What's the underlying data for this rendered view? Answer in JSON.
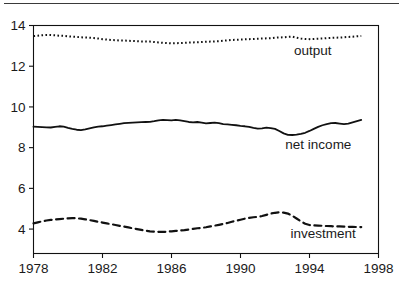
{
  "figure": {
    "top_rule": true,
    "background_color": "#ffffff",
    "line_color": "#111111"
  },
  "chart_data": {
    "type": "line",
    "title": "",
    "subtitle": "",
    "xlabel": "",
    "ylabel": "",
    "xlim": [
      1978,
      1998
    ],
    "ylim": [
      2.8,
      14
    ],
    "grid": false,
    "legend_position": "inline-right",
    "xticks": [
      1978,
      1982,
      1986,
      1990,
      1994,
      1998
    ],
    "xtick_labels": [
      "1978",
      "1982",
      "1986",
      "1990",
      "1994",
      "1998"
    ],
    "yticks": [
      4,
      6,
      8,
      10,
      12,
      14
    ],
    "ytick_labels": [
      "4",
      "6",
      "8",
      "10",
      "12",
      "14"
    ],
    "x": [
      1978.0,
      1978.25,
      1978.5,
      1978.75,
      1979.0,
      1979.25,
      1979.5,
      1979.75,
      1980.0,
      1980.25,
      1980.5,
      1980.75,
      1981.0,
      1981.25,
      1981.5,
      1981.75,
      1982.0,
      1982.25,
      1982.5,
      1982.75,
      1983.0,
      1983.25,
      1983.5,
      1983.75,
      1984.0,
      1984.25,
      1984.5,
      1984.75,
      1985.0,
      1985.25,
      1985.5,
      1985.75,
      1986.0,
      1986.25,
      1986.5,
      1986.75,
      1987.0,
      1987.25,
      1987.5,
      1987.75,
      1988.0,
      1988.25,
      1988.5,
      1988.75,
      1989.0,
      1989.25,
      1989.5,
      1989.75,
      1990.0,
      1990.25,
      1990.5,
      1990.75,
      1991.0,
      1991.25,
      1991.5,
      1991.75,
      1992.0,
      1992.25,
      1992.5,
      1992.75,
      1993.0,
      1993.25,
      1993.5,
      1993.75,
      1994.0,
      1994.25,
      1994.5,
      1994.75,
      1995.0,
      1995.25,
      1995.5,
      1995.75,
      1996.0,
      1996.25,
      1996.5,
      1996.75,
      1997.0
    ],
    "series": [
      {
        "name": "output",
        "label": "output",
        "style": "dotted",
        "label_x": 1993.1,
        "label_y": 12.55,
        "values": [
          13.48,
          13.5,
          13.52,
          13.53,
          13.53,
          13.52,
          13.5,
          13.49,
          13.47,
          13.45,
          13.44,
          13.42,
          13.41,
          13.4,
          13.38,
          13.36,
          13.33,
          13.31,
          13.29,
          13.28,
          13.26,
          13.26,
          13.25,
          13.24,
          13.23,
          13.22,
          13.22,
          13.21,
          13.19,
          13.17,
          13.15,
          13.14,
          13.12,
          13.13,
          13.14,
          13.15,
          13.16,
          13.17,
          13.18,
          13.19,
          13.2,
          13.21,
          13.22,
          13.23,
          13.25,
          13.27,
          13.29,
          13.3,
          13.31,
          13.32,
          13.33,
          13.34,
          13.35,
          13.36,
          13.37,
          13.38,
          13.4,
          13.41,
          13.42,
          13.44,
          13.45,
          13.4,
          13.36,
          13.34,
          13.33,
          13.34,
          13.35,
          13.36,
          13.38,
          13.39,
          13.4,
          13.41,
          13.42,
          13.44,
          13.45,
          13.47,
          13.48
        ]
      },
      {
        "name": "net-income",
        "label": "net income",
        "style": "solid",
        "label_x": 1992.6,
        "label_y": 7.95,
        "values": [
          9.03,
          9.02,
          9.01,
          9.0,
          8.99,
          9.02,
          9.05,
          9.03,
          8.97,
          8.92,
          8.88,
          8.86,
          8.9,
          8.95,
          9.0,
          9.03,
          9.05,
          9.08,
          9.11,
          9.14,
          9.17,
          9.2,
          9.22,
          9.23,
          9.24,
          9.25,
          9.26,
          9.27,
          9.3,
          9.34,
          9.36,
          9.35,
          9.34,
          9.36,
          9.34,
          9.3,
          9.26,
          9.24,
          9.26,
          9.23,
          9.19,
          9.21,
          9.23,
          9.2,
          9.16,
          9.14,
          9.12,
          9.1,
          9.07,
          9.05,
          9.02,
          8.97,
          8.93,
          8.95,
          8.98,
          8.96,
          8.92,
          8.82,
          8.7,
          8.63,
          8.62,
          8.64,
          8.68,
          8.73,
          8.82,
          8.92,
          9.02,
          9.1,
          9.16,
          9.2,
          9.21,
          9.18,
          9.15,
          9.18,
          9.24,
          9.3,
          9.36
        ]
      },
      {
        "name": "investment",
        "label": "investment",
        "style": "dashed",
        "label_x": 1992.9,
        "label_y": 3.55,
        "values": [
          4.28,
          4.33,
          4.38,
          4.42,
          4.45,
          4.47,
          4.49,
          4.51,
          4.53,
          4.54,
          4.53,
          4.51,
          4.48,
          4.44,
          4.4,
          4.36,
          4.32,
          4.28,
          4.24,
          4.2,
          4.16,
          4.12,
          4.08,
          4.04,
          4.0,
          3.96,
          3.92,
          3.89,
          3.87,
          3.86,
          3.86,
          3.87,
          3.89,
          3.91,
          3.93,
          3.95,
          3.98,
          4.01,
          4.04,
          4.06,
          4.09,
          4.13,
          4.17,
          4.21,
          4.25,
          4.3,
          4.36,
          4.41,
          4.46,
          4.51,
          4.55,
          4.58,
          4.6,
          4.64,
          4.7,
          4.76,
          4.8,
          4.82,
          4.81,
          4.76,
          4.66,
          4.52,
          4.38,
          4.26,
          4.2,
          4.18,
          4.17,
          4.16,
          4.15,
          4.14,
          4.13,
          4.13,
          4.12,
          4.11,
          4.11,
          4.1,
          4.1
        ]
      }
    ]
  }
}
